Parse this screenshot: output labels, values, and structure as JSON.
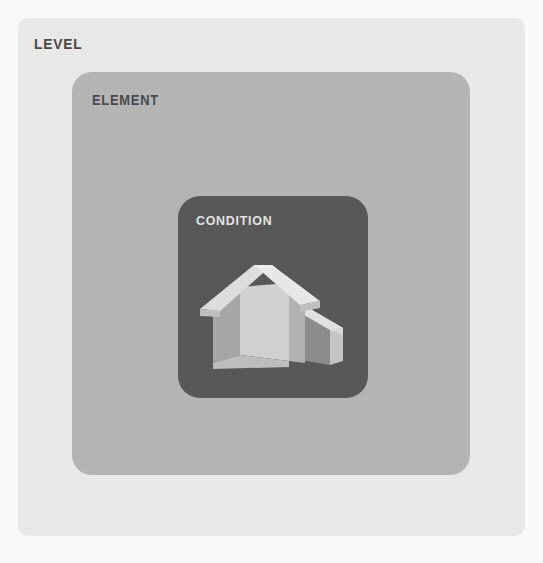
{
  "diagram": {
    "levels": [
      {
        "key": "level",
        "label": "LEVEL",
        "depth": 0,
        "fill": "#eeeeee",
        "label_color": "#4a4a4a"
      },
      {
        "key": "element",
        "label": "ELEMENT",
        "depth": 1,
        "fill": "#b9b9b9",
        "label_color": "#4c4c4c"
      },
      {
        "key": "condition",
        "label": "CONDITION",
        "depth": 2,
        "fill": "#5a5a5a",
        "label_color": "#e9e9e9"
      }
    ],
    "icon": {
      "name": "house-icon",
      "description": "3D isometric house with gabled roof and lower side wing",
      "roof_color": "#dedede",
      "front_wall_color": "#d2d2d2",
      "side_wall_color": "#a9a9a9",
      "recess_color": "#8f8f8f"
    },
    "background": "#ffffff"
  }
}
